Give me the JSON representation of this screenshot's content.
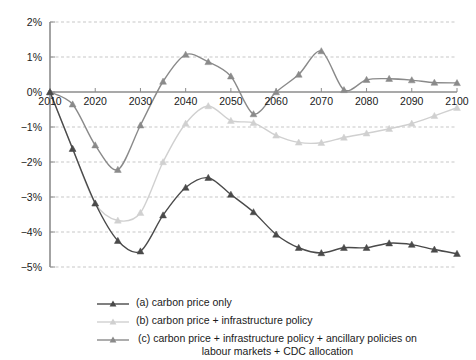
{
  "chart_data": {
    "type": "line",
    "title": "",
    "xlabel": "",
    "ylabel": "",
    "x": [
      2010,
      2015,
      2020,
      2025,
      2030,
      2035,
      2040,
      2045,
      2050,
      2055,
      2060,
      2065,
      2070,
      2075,
      2080,
      2085,
      2090,
      2095,
      2100
    ],
    "xlim": [
      2010,
      2100
    ],
    "ylim": [
      -5,
      2
    ],
    "xticks": [
      "2010",
      "2020",
      "2030",
      "2040",
      "2050",
      "2060",
      "2070",
      "2080",
      "2090",
      "2100"
    ],
    "xtick_values": [
      2010,
      2020,
      2030,
      2040,
      2050,
      2060,
      2070,
      2080,
      2090,
      2100
    ],
    "yticks": [
      "2%",
      "1%",
      "0%",
      "-1%",
      "-2%",
      "-3%",
      "-4%",
      "-5%"
    ],
    "ytick_values": [
      2,
      1,
      0,
      -1,
      -2,
      -3,
      -4,
      -5
    ],
    "grid": true,
    "grid_style": "dashed-horizontal",
    "legend_position": "bottom",
    "series": [
      {
        "name": "(a) carbon price only",
        "key": "a",
        "color": "#4a4a4a",
        "marker": "triangle",
        "values": [
          0.0,
          -1.62,
          -3.18,
          -4.25,
          -4.55,
          -3.52,
          -2.73,
          -2.45,
          -2.93,
          -3.43,
          -4.07,
          -4.45,
          -4.6,
          -4.45,
          -4.45,
          -4.32,
          -4.36,
          -4.5,
          -4.62
        ]
      },
      {
        "name": "(b) carbon price + infrastructure policy",
        "key": "b",
        "color": "#d0d0d0",
        "marker": "triangle",
        "values": [
          0.0,
          -1.62,
          -3.18,
          -3.67,
          -3.45,
          -2.0,
          -0.9,
          -0.4,
          -0.82,
          -0.88,
          -1.24,
          -1.44,
          -1.45,
          -1.3,
          -1.18,
          -1.05,
          -0.9,
          -0.68,
          -0.45
        ]
      },
      {
        "name": "(c) carbon price + infrastructure policy + ancillary policies on labour markets + CDC allocation",
        "key": "c",
        "color": "#8a8a8a",
        "marker": "triangle",
        "values": [
          0.0,
          -0.35,
          -1.52,
          -2.22,
          -0.95,
          0.3,
          1.07,
          0.86,
          0.45,
          -0.63,
          0.0,
          0.5,
          1.17,
          0.06,
          0.35,
          0.38,
          0.34,
          0.27,
          0.26
        ]
      }
    ]
  },
  "legend": {
    "items": [
      {
        "label": "(a) carbon price only",
        "color": "#4a4a4a",
        "wrapped": false
      },
      {
        "label": "(b) carbon price + infrastructure policy",
        "color": "#d0d0d0",
        "wrapped": false
      },
      {
        "label": "(c) carbon price + infrastructure policy + ancillary policies on\nlabour markets + CDC allocation",
        "color": "#8a8a8a",
        "wrapped": true
      }
    ]
  },
  "axes": {
    "zero_line_label": "0%",
    "axis_color": "#8c8c8c",
    "grid_color": "#b9b9b9"
  }
}
